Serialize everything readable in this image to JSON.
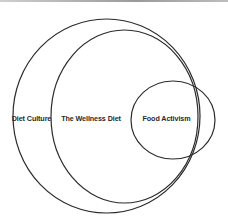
{
  "diagram": {
    "type": "venn",
    "stroke_color": "#2b2b2b",
    "background_color": "#ffffff",
    "sets": [
      {
        "id": "diet_culture",
        "label": "Diet Culture",
        "shape": {
          "cx": 106.5,
          "cy": 116,
          "rx": 93.5,
          "ry": 97
        },
        "label_pos": {
          "x": 31.5,
          "y": 120.5
        }
      },
      {
        "id": "wellness_diet",
        "label": "The Wellness Diet",
        "shape": {
          "cx": 124.5,
          "cy": 116.5,
          "rx": 73.5,
          "ry": 86.5
        },
        "label_pos": {
          "x": 91,
          "y": 120.5
        }
      },
      {
        "id": "food_activism",
        "label": "Food Activism",
        "shape": {
          "cx": 173,
          "cy": 120,
          "rx": 42,
          "ry": 39
        },
        "label_pos": {
          "x": 166.5,
          "y": 120.5
        }
      }
    ],
    "relationships": [
      "The Wellness Diet is contained within Diet Culture",
      "Food Activism partially overlaps The Wellness Diet and Diet Culture"
    ]
  }
}
